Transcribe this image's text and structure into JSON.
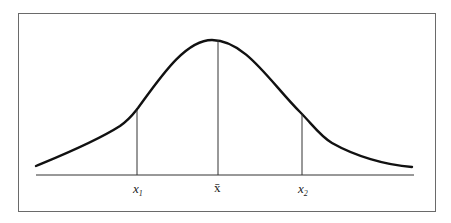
{
  "diagram": {
    "type": "normal-distribution-curve",
    "labels": {
      "left_marker": "x",
      "left_marker_sub": "1",
      "mean_marker": "x̄",
      "right_marker": "x",
      "right_marker_sub": "2"
    },
    "colors": {
      "curve": "#111111",
      "lines": "#333333",
      "frame": "#6a6a6a"
    }
  }
}
